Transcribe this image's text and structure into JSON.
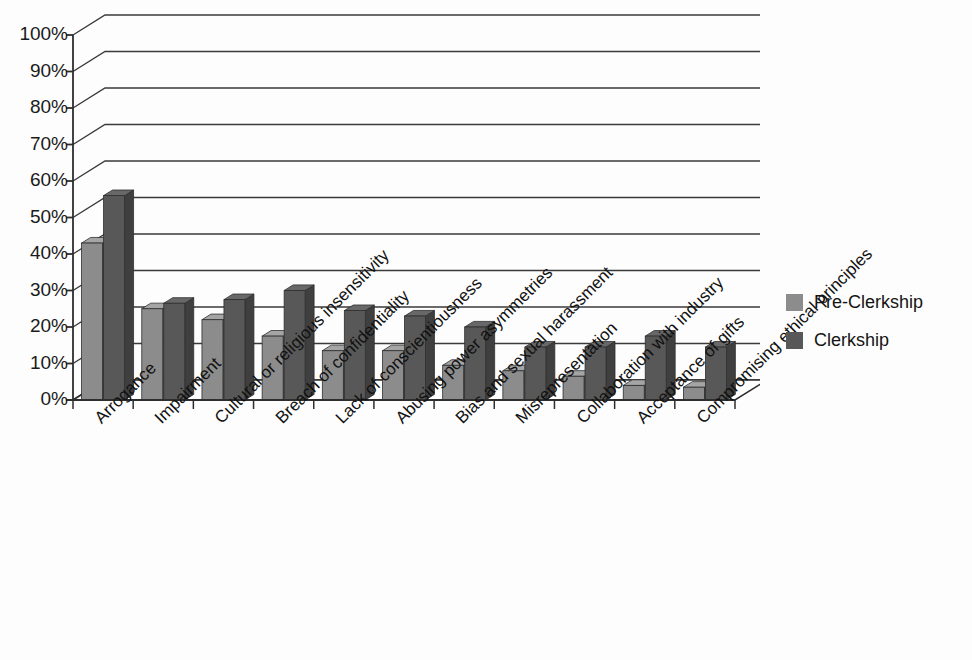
{
  "legend": {
    "position": "right",
    "items": [
      {
        "label": "Pre-Clerkship",
        "color": "#8c8c8c"
      },
      {
        "label": "Clerkship",
        "color": "#585858"
      }
    ]
  },
  "axes": {
    "y_ticks": [
      "0%",
      "10%",
      "20%",
      "30%",
      "40%",
      "50%",
      "60%",
      "70%",
      "80%",
      "90%",
      "100%"
    ]
  },
  "bleed_text": {
    "right_column": "",
    "mid_column": "",
    "bottom_line": ""
  },
  "chart_data": {
    "type": "bar",
    "title": "",
    "subtitle": "",
    "xlabel": "",
    "ylabel": "",
    "ylim": [
      0,
      100
    ],
    "ytick_values": [
      0,
      10,
      20,
      30,
      40,
      50,
      60,
      70,
      80,
      90,
      100
    ],
    "ytick_labels": [
      "0%",
      "10%",
      "20%",
      "30%",
      "40%",
      "50%",
      "60%",
      "70%",
      "80%",
      "90%",
      "100%"
    ],
    "grid": true,
    "grid_axis": "y",
    "three_d": true,
    "legend_position": "right",
    "legend_entries": [
      "Pre-Clerkship",
      "Clerkship"
    ],
    "categories": [
      "Arrogance",
      "Impairment",
      "Cultural or religious insensitivity",
      "Breach of confidentiality",
      "Lack of conscientiousness",
      "Abusing power asymmetries",
      "Bias and sexual harassment",
      "Misrepresentation",
      "Collaboration with industry",
      "Acceptance of gifts",
      "Compromising ethical principles"
    ],
    "series": [
      {
        "name": "Pre-Clerkship",
        "color": "#8c8c8c",
        "values": [
          43,
          25,
          22,
          17.5,
          13.5,
          13.5,
          9.5,
          8,
          6.5,
          4,
          3.5
        ]
      },
      {
        "name": "Clerkship",
        "color": "#585858",
        "values": [
          56,
          26.5,
          27.5,
          30,
          24.5,
          23,
          20,
          14.5,
          14.5,
          17.5,
          14.5
        ]
      }
    ]
  }
}
